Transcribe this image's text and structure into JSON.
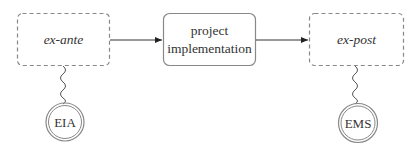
{
  "diagram": {
    "nodes": {
      "ex_ante": {
        "label": "ex-ante",
        "style": "dashed"
      },
      "project": {
        "line1": "project",
        "line2": "implementation",
        "style": "solid"
      },
      "ex_post": {
        "label": "ex-post",
        "style": "dashed"
      },
      "eia": {
        "label": "EIA",
        "shape": "double-circle"
      },
      "ems": {
        "label": "EMS",
        "shape": "double-circle"
      }
    },
    "edges": [
      {
        "from": "ex-ante",
        "to": "project implementation",
        "type": "arrow"
      },
      {
        "from": "project implementation",
        "to": "ex-post",
        "type": "arrow"
      },
      {
        "from": "ex-ante",
        "to": "EIA",
        "type": "wavy"
      },
      {
        "from": "ex-post",
        "to": "EMS",
        "type": "wavy"
      }
    ],
    "colors": {
      "stroke": "#777777",
      "text": "#333333"
    }
  }
}
